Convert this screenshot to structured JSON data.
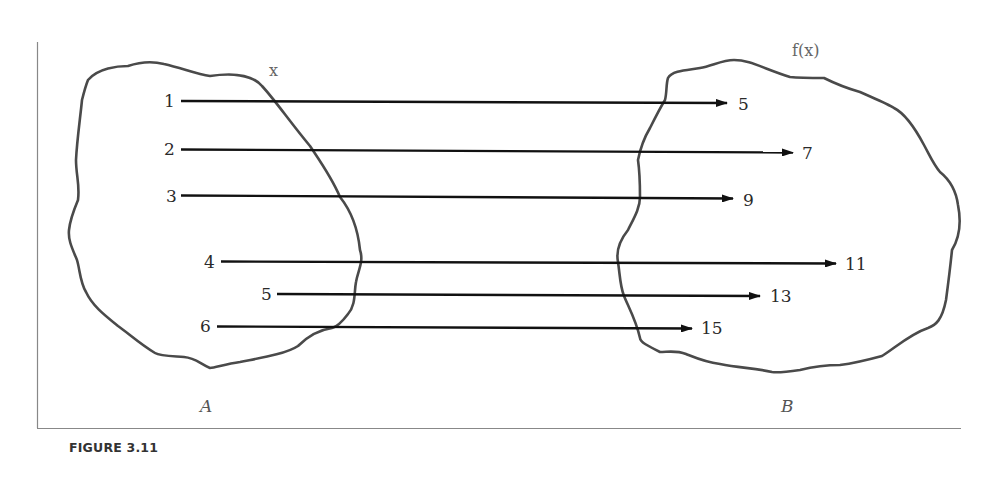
{
  "figure": {
    "caption": "FIGURE 3.11",
    "domain_label": "x",
    "codomain_label": "f(x)",
    "set_a_label": "A",
    "set_b_label": "B"
  },
  "mapping": [
    {
      "input": "1",
      "output": "5"
    },
    {
      "input": "2",
      "output": "7"
    },
    {
      "input": "3",
      "output": "9"
    },
    {
      "input": "4",
      "output": "11"
    },
    {
      "input": "5",
      "output": "13"
    },
    {
      "input": "6",
      "output": "15"
    }
  ],
  "colors": {
    "outline": "#4a4a4a",
    "arrow": "#111111",
    "frame": "#888888"
  }
}
